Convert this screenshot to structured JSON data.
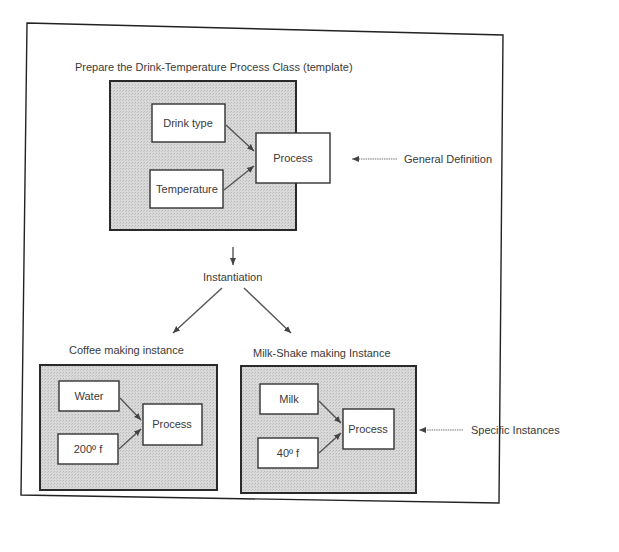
{
  "title": "Prepare the Drink-Temperature Process Class (template)",
  "template": {
    "inputs": [
      "Drink type",
      "Temperature"
    ],
    "process": "Process",
    "annotation": "General Definition"
  },
  "instantiation_label": "Instantiation",
  "instances": [
    {
      "title": "Coffee making instance",
      "inputs": [
        "Water",
        "200º f"
      ],
      "process": "Process"
    },
    {
      "title": "Milk-Shake making Instance",
      "inputs": [
        "Milk",
        "40º f"
      ],
      "process": "Process"
    }
  ],
  "instances_annotation": "Specific Instances",
  "colors": {
    "group_fill": "#d4d4d4",
    "frame": "#2a2a2a",
    "node_fill": "#ffffff"
  }
}
